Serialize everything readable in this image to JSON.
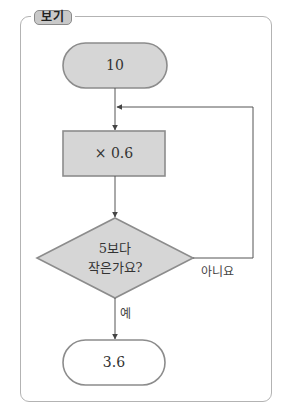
{
  "badge": {
    "label": "보기"
  },
  "flowchart": {
    "start": {
      "label": "10",
      "fill": "#d6d6d6"
    },
    "process": {
      "label": "× 0.6",
      "fill": "#d6d6d6"
    },
    "decision": {
      "line1": "5보다",
      "line2": "작은가요?",
      "fill": "#d6d6d6"
    },
    "end": {
      "label": "3.6",
      "fill": "#ffffff"
    },
    "edges": {
      "no_label": "아니요",
      "yes_label": "예"
    }
  },
  "colors": {
    "stroke": "#8c8c8c",
    "line": "#555555",
    "frame": "#b3b3b3"
  }
}
